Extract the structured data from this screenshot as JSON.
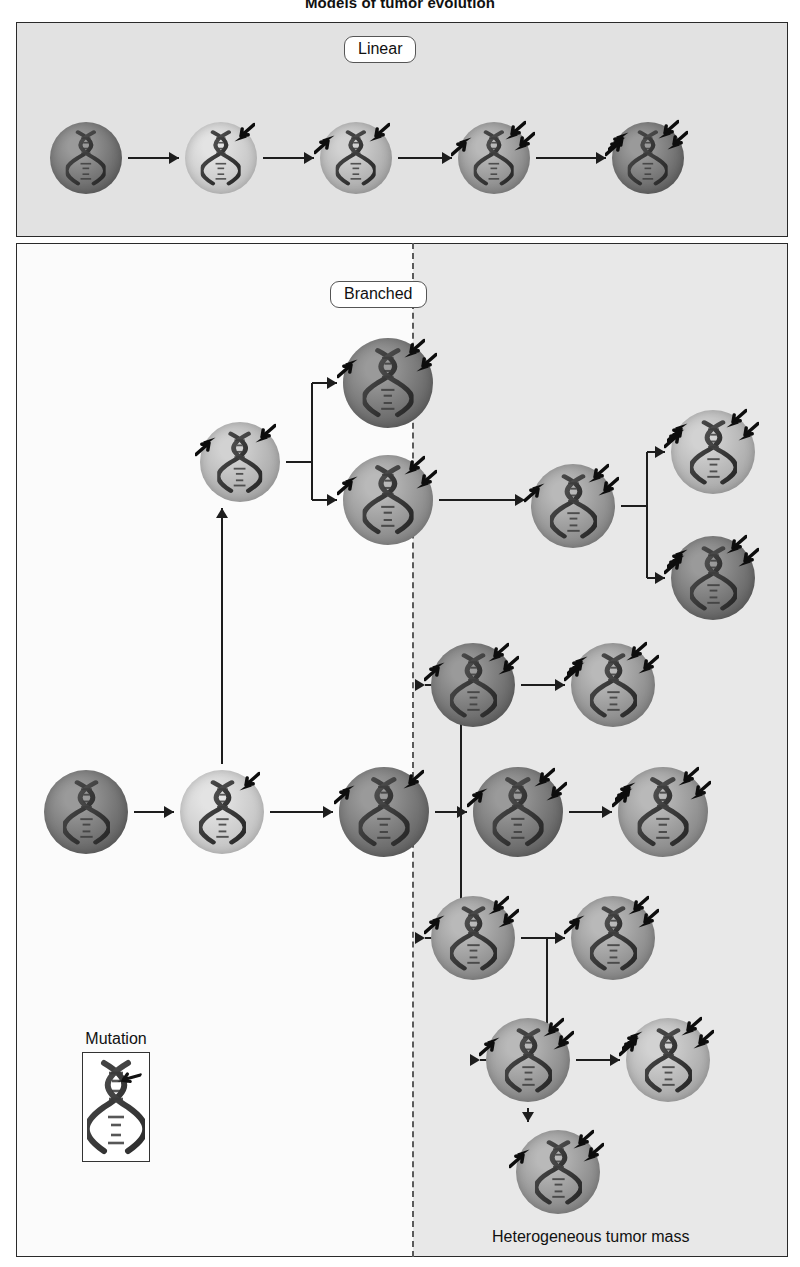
{
  "figure": {
    "title": "Models of tumor evolution",
    "mass_label": "Heterogeneous tumor mass"
  },
  "panels": {
    "linear": {
      "chip_label": "Linear"
    },
    "branched": {
      "chip_label": "Branched"
    }
  },
  "legend": {
    "title": "Mutation",
    "icon": "dna-helix-with-arrow"
  },
  "icons": {
    "mutation": "mutation-arrow-icon",
    "dna": "dna-helix-icon",
    "flow": "flow-arrow-icon",
    "divider": "dashed-divider-icon"
  },
  "colors": {
    "panel_linear_bg": "#e2e2e2",
    "panel_branched_bg": "#fbfbfb",
    "panel_branched_shade": "#e8e8e8",
    "border": "#2a2a2a",
    "arrow": "#1d1d1d",
    "divider": "#5a5a5a",
    "cell_tone_dark": "#6f6f6f",
    "cell_tone_mid": "#8e8e8e",
    "cell_tone_light": "#b4b4b4",
    "cell_tone_pale": "#cfcfcf"
  },
  "chart_data": {
    "type": "diagram",
    "title": "Models of tumor evolution",
    "legend": [
      {
        "symbol": "arrow",
        "label": "Mutation"
      }
    ],
    "panels": [
      {
        "name": "Linear",
        "label": "Linear",
        "nodes": [
          {
            "id": "L1",
            "x": 86,
            "y": 158,
            "r": 36,
            "tone": "dark",
            "mutations": 0
          },
          {
            "id": "L2",
            "x": 221,
            "y": 158,
            "r": 36,
            "tone": "pale",
            "mutations": 1
          },
          {
            "id": "L3",
            "x": 356,
            "y": 158,
            "r": 36,
            "tone": "light",
            "mutations": 2
          },
          {
            "id": "L4",
            "x": 494,
            "y": 158,
            "r": 36,
            "tone": "mid",
            "mutations": 3
          },
          {
            "id": "L5",
            "x": 648,
            "y": 158,
            "r": 36,
            "tone": "dark",
            "mutations": 4
          }
        ],
        "edges": [
          {
            "from": "L1",
            "to": "L2",
            "kind": "straight"
          },
          {
            "from": "L2",
            "to": "L3",
            "kind": "straight"
          },
          {
            "from": "L3",
            "to": "L4",
            "kind": "straight"
          },
          {
            "from": "L4",
            "to": "L5",
            "kind": "straight"
          }
        ]
      },
      {
        "name": "Branched",
        "label": "Branched",
        "divider_x": 412,
        "nodes": [
          {
            "id": "B1",
            "x": 86,
            "y": 812,
            "r": 42,
            "tone": "dark",
            "mutations": 0
          },
          {
            "id": "B2",
            "x": 222,
            "y": 812,
            "r": 42,
            "tone": "pale",
            "mutations": 1
          },
          {
            "id": "B3",
            "x": 240,
            "y": 462,
            "r": 40,
            "tone": "light",
            "mutations": 2
          },
          {
            "id": "B4",
            "x": 388,
            "y": 383,
            "r": 45,
            "tone": "dark",
            "mutations": 3
          },
          {
            "id": "B5",
            "x": 388,
            "y": 500,
            "r": 45,
            "tone": "mid",
            "mutations": 3
          },
          {
            "id": "B6",
            "x": 573,
            "y": 506,
            "r": 42,
            "tone": "mid",
            "mutations": 3
          },
          {
            "id": "B7",
            "x": 713,
            "y": 452,
            "r": 42,
            "tone": "light",
            "mutations": 4
          },
          {
            "id": "B8",
            "x": 713,
            "y": 578,
            "r": 42,
            "tone": "dark",
            "mutations": 4
          },
          {
            "id": "B9",
            "x": 384,
            "y": 812,
            "r": 45,
            "tone": "dark",
            "mutations": 2
          },
          {
            "id": "B10",
            "x": 473,
            "y": 685,
            "r": 42,
            "tone": "dark",
            "mutations": 3
          },
          {
            "id": "B11",
            "x": 613,
            "y": 685,
            "r": 42,
            "tone": "mid",
            "mutations": 4
          },
          {
            "id": "B12",
            "x": 518,
            "y": 812,
            "r": 45,
            "tone": "dark",
            "mutations": 3
          },
          {
            "id": "B13",
            "x": 663,
            "y": 812,
            "r": 45,
            "tone": "mid",
            "mutations": 4
          },
          {
            "id": "B14",
            "x": 473,
            "y": 938,
            "r": 42,
            "tone": "mid",
            "mutations": 3
          },
          {
            "id": "B15",
            "x": 613,
            "y": 938,
            "r": 42,
            "tone": "mid",
            "mutations": 3
          },
          {
            "id": "B16",
            "x": 528,
            "y": 1060,
            "r": 42,
            "tone": "mid",
            "mutations": 3
          },
          {
            "id": "B17",
            "x": 668,
            "y": 1060,
            "r": 42,
            "tone": "light",
            "mutations": 4
          },
          {
            "id": "B18",
            "x": 558,
            "y": 1172,
            "r": 42,
            "tone": "mid",
            "mutations": 3
          }
        ],
        "edges": [
          {
            "from": "B1",
            "to": "B2",
            "kind": "straight"
          },
          {
            "from": "B2",
            "to": "B3",
            "kind": "up"
          },
          {
            "from": "B2",
            "to": "B9",
            "kind": "straight"
          },
          {
            "from": "B3",
            "to": "B4",
            "kind": "fork-up"
          },
          {
            "from": "B3",
            "to": "B5",
            "kind": "fork-down"
          },
          {
            "from": "B5",
            "to": "B6",
            "kind": "straight"
          },
          {
            "from": "B6",
            "to": "B7",
            "kind": "fork-up"
          },
          {
            "from": "B6",
            "to": "B8",
            "kind": "fork-down"
          },
          {
            "from": "B9",
            "to": "B10",
            "kind": "fork-up"
          },
          {
            "from": "B9",
            "to": "B12",
            "kind": "straight"
          },
          {
            "from": "B9",
            "to": "B14",
            "kind": "fork-down"
          },
          {
            "from": "B10",
            "to": "B11",
            "kind": "straight"
          },
          {
            "from": "B12",
            "to": "B13",
            "kind": "straight"
          },
          {
            "from": "B14",
            "to": "B15",
            "kind": "straight"
          },
          {
            "from": "B14",
            "to": "B16",
            "kind": "fork-down"
          },
          {
            "from": "B16",
            "to": "B17",
            "kind": "straight"
          },
          {
            "from": "B16",
            "to": "B18",
            "kind": "down"
          }
        ]
      }
    ]
  }
}
